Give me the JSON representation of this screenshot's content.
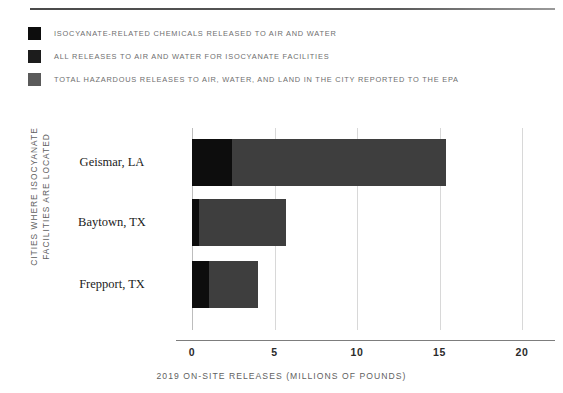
{
  "chart_data": {
    "type": "bar",
    "orientation": "horizontal",
    "overlap": true,
    "title": "",
    "xlabel": "2019 ON-SITE RELEASES (MILLIONS OF POUNDS)",
    "ylabel_lines": [
      "CITIES WHERE ISOCYANATE",
      "FACILITIES ARE LOCATED"
    ],
    "categories": [
      "Geismar, LA",
      "Baytown, TX",
      "Frepport, TX"
    ],
    "xlim": [
      0,
      20
    ],
    "xticks": [
      0,
      5,
      10,
      15,
      20
    ],
    "xtick_labels": [
      "0",
      "5",
      "10",
      "15",
      "20"
    ],
    "grid": true,
    "legend_position": "top-left",
    "series": [
      {
        "name": "ISOCYANATE-RELATED CHEMICALS RELEASED TO AIR AND WATER",
        "color": "#0d0d0d",
        "values": [
          2.4,
          0.4,
          1.0
        ]
      },
      {
        "name": "ALL RELEASES TO AIR AND WATER FOR ISOCYANATE FACILITIES",
        "color": "#1c1c1c",
        "values": [
          2.45,
          0.45,
          1.05
        ]
      },
      {
        "name": "TOTAL HAZARDOUS RELEASES TO AIR, WATER, AND LAND IN THE CITY REPORTED TO THE EPA",
        "color": "#3e3e3e",
        "values": [
          15.4,
          5.7,
          4.0
        ]
      }
    ]
  },
  "legend": {
    "items": [
      {
        "label": "ISOCYANATE-RELATED CHEMICALS RELEASED TO AIR AND WATER",
        "color": "#0d0d0d"
      },
      {
        "label": "ALL RELEASES TO AIR AND WATER FOR ISOCYANATE FACILITIES",
        "color": "#1c1c1c"
      },
      {
        "label": "TOTAL HAZARDOUS RELEASES TO AIR, WATER, AND LAND IN THE CITY REPORTED TO THE EPA",
        "color": "#5a5a5a"
      }
    ]
  },
  "axes": {
    "x_title": "2019 ON-SITE RELEASES (MILLIONS OF POUNDS)",
    "y_title_line1": "CITIES WHERE ISOCYANATE",
    "y_title_line2": "FACILITIES ARE LOCATED",
    "x_ticks": [
      "0",
      "5",
      "10",
      "15",
      "20"
    ],
    "y_ticks": [
      "Geismar, LA",
      "Baytown, TX",
      "Frepport, TX"
    ]
  },
  "colors": {
    "bar_dark": "#0d0d0d",
    "bar_mid": "#1c1c1c",
    "bar_gray": "#3e3e3e",
    "legend_text": "#6e6e6e",
    "gridline": "#d8d8d8",
    "axis": "#7d7d7d",
    "rule": "#4a4a4a",
    "background": "#ffffff"
  }
}
